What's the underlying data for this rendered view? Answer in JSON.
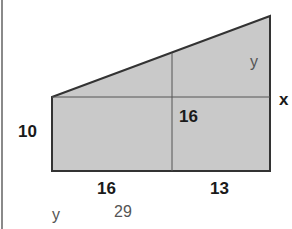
{
  "diagram": {
    "shape": "trapezoid composed of rectangle and right triangle",
    "colors": {
      "fill": "#c8c8c8",
      "stroke": "#333333",
      "divider": "#555555"
    },
    "labels": {
      "left_height": "10",
      "inner_height": "16",
      "bottom_left_width": "16",
      "bottom_right_width": "13",
      "right_side_x": "x",
      "inner_y": "y",
      "answer_label": "y",
      "answer_value": "29"
    }
  }
}
